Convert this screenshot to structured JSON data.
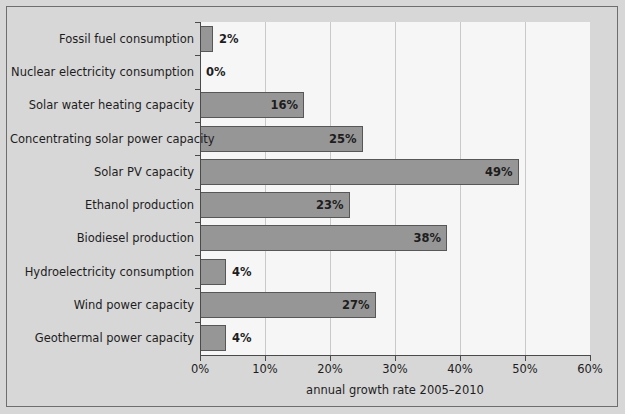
{
  "chart_data": {
    "type": "bar",
    "orientation": "horizontal",
    "title": "",
    "xlabel": "annual growth rate 2005–2010",
    "ylabel": "",
    "xlim": [
      0,
      60
    ],
    "xunit": "%",
    "grid": true,
    "legend": null,
    "categories": [
      "Fossil fuel consumption",
      "Nuclear electricity consumption",
      "Solar water heating capacity",
      "Concentrating solar power capacity",
      "Solar PV capacity",
      "Ethanol production",
      "Biodiesel production",
      "Hydroelectricity consumption",
      "Wind power capacity",
      "Geothermal power capacity"
    ],
    "values": [
      2,
      0,
      16,
      25,
      49,
      23,
      38,
      4,
      27,
      4
    ],
    "value_labels": [
      "2%",
      "0%",
      "16%",
      "25%",
      "49%",
      "23%",
      "38%",
      "4%",
      "27%",
      "4%"
    ],
    "xticks": [
      0,
      10,
      20,
      30,
      40,
      50,
      60
    ],
    "xtick_labels": [
      "0%",
      "10%",
      "20%",
      "30%",
      "40%",
      "50%",
      "60%"
    ],
    "colors": {
      "bar_fill": "#969696",
      "bar_edge": "#575757",
      "plot_background": "#f6f6f6",
      "figure_background": "#d7d7d7",
      "gridline": "#c9c9c9",
      "axis": "#4a4a4a",
      "text": "#1d1d1d"
    }
  }
}
